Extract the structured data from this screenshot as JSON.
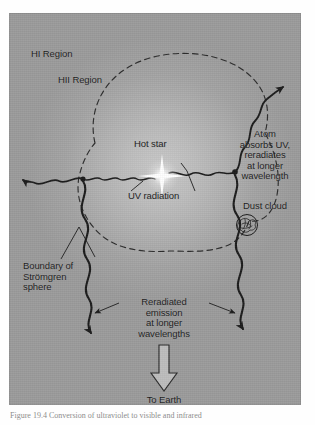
{
  "figure": {
    "panel": {
      "background_color": "#b3b3b3",
      "glow_color": "#c9c9c9",
      "ink_color": "#1b1b1b"
    },
    "labels": {
      "hi_region": "HI Region",
      "hii_region": "HII Region",
      "hot_star": "Hot star",
      "uv_radiation": "UV radiation",
      "atom_absorbs": "Atom\nabsorbs UV,\nreradiates\nat longer\nwavelength",
      "dust_cloud": "Dust cloud",
      "boundary": "Boundary of\nStrömgren\nsphere",
      "reradiated": "Reradiated\nemission\nat longer\nwavelengths",
      "to_earth": "To Earth"
    },
    "elements": {
      "star_name": "hot-star-glyph",
      "boundary_style": "dashed",
      "photon_style": "wavy-arrow",
      "dust_cloud_style": "scribble-blob",
      "earth_arrow_style": "hollow-block-arrow"
    }
  },
  "caption": {
    "text": "Figure 19.4  Conversion of ultraviolet to visible and infrared"
  }
}
